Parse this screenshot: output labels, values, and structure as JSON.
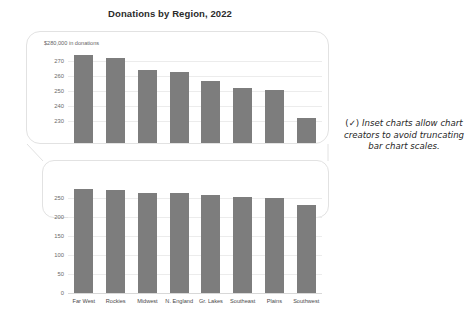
{
  "title": "Donations by Region, 2022",
  "annotation": {
    "check_glyph": "(✓)",
    "text": "Inset charts allow chart creators to avoid truncating bar chart scales."
  },
  "colors": {
    "bar": "#7d7d7d",
    "grid": "#ececec",
    "callout_border": "#e2e2e2",
    "text": "#4a4a4a",
    "title": "#2b2b2b",
    "background": "#ffffff"
  },
  "chart_data": [
    {
      "type": "bar",
      "id": "inset-zoomed-chart",
      "title": "Donations by Region, 2022",
      "axis_note": "$280,000 in donations",
      "xlabel": "",
      "ylabel": "",
      "grid": true,
      "legend": "none",
      "ylim": [
        225,
        280
      ],
      "yticks": [
        270,
        260,
        250,
        240,
        230
      ],
      "categories": [
        "Far West",
        "Rockies",
        "Midwest",
        "N. England",
        "Gr. Lakes",
        "Southeast",
        "Plains",
        "Southwest"
      ],
      "values": [
        274,
        272,
        264,
        263,
        257,
        252,
        251,
        232
      ],
      "note": "truncated-scale inset view, bars clipped at frame bottom"
    },
    {
      "type": "bar",
      "id": "full-scale-chart",
      "axis_note": "$300,000 in donations",
      "xlabel": "",
      "ylabel": "",
      "grid": true,
      "legend": "none",
      "ylim": [
        0,
        300
      ],
      "yticks": [
        250,
        200,
        150,
        100,
        50,
        0
      ],
      "categories": [
        "Far West",
        "Rockies",
        "Midwest",
        "N. England",
        "Gr. Lakes",
        "Southeast",
        "Plains",
        "Southwest"
      ],
      "values": [
        274,
        272,
        264,
        263,
        257,
        252,
        251,
        232
      ]
    }
  ]
}
